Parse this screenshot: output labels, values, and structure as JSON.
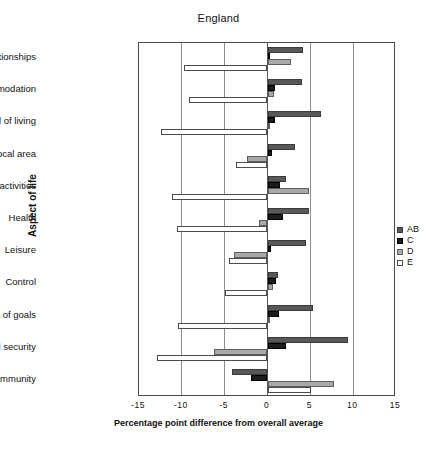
{
  "chart_data": {
    "type": "bar",
    "orientation": "horizontal",
    "title": "England",
    "xlabel": "Percentage point difference from overall average",
    "ylabel": "Aspect of life",
    "xlim": [
      -15,
      15
    ],
    "xticks": [
      -15,
      -10,
      -5,
      0,
      5,
      10,
      15
    ],
    "xtick_labels": [
      "-15",
      "-10",
      "-5",
      "0",
      "5",
      "10",
      "15"
    ],
    "grid": true,
    "legend_position": "right",
    "categories": [
      "Relationships",
      "Accommodation",
      "Standard of living",
      "Local area",
      "Day to day activities",
      "Health",
      "Leisure",
      "Control",
      "Achievement of goals",
      "Future financial security",
      "Community"
    ],
    "series": [
      {
        "name": "AB",
        "color": "#58585a",
        "values": [
          4.2,
          4.0,
          6.3,
          3.2,
          2.2,
          4.9,
          4.5,
          1.2,
          5.3,
          9.4,
          -4.2
        ]
      },
      {
        "name": "C",
        "color": "#1b1b1b",
        "values": [
          0.3,
          0.9,
          0.9,
          0.5,
          1.5,
          1.8,
          0.4,
          1.0,
          1.3,
          2.2,
          -1.9
        ]
      },
      {
        "name": "D",
        "color": "#a9a9ab",
        "values": [
          2.7,
          0.8,
          0.2,
          -2.4,
          4.8,
          -1.0,
          -3.9,
          0.6,
          0.1,
          -6.2,
          7.8
        ]
      },
      {
        "name": "E",
        "color": "#ffffff",
        "values": [
          -9.8,
          -9.2,
          -12.4,
          -3.7,
          -11.1,
          -10.6,
          -4.5,
          -5.0,
          -10.4,
          -12.9,
          5.1
        ]
      }
    ]
  },
  "legend": {
    "items": [
      {
        "key": "AB",
        "label": "AB"
      },
      {
        "key": "C",
        "label": "C"
      },
      {
        "key": "D",
        "label": "D"
      },
      {
        "key": "E",
        "label": "E"
      }
    ]
  }
}
